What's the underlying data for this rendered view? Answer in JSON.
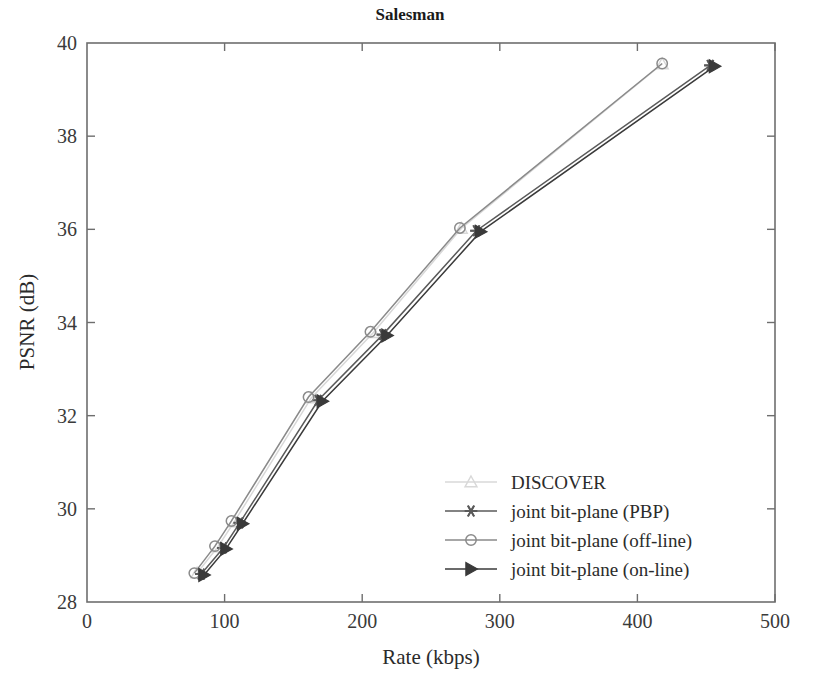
{
  "chart_data": {
    "type": "line",
    "title": "Salesman",
    "xlabel": "Rate (kbps)",
    "ylabel": "PSNR (dB)",
    "xlim": [
      0,
      500
    ],
    "ylim": [
      28,
      40
    ],
    "xticks": [
      "0",
      "100",
      "200",
      "300",
      "400",
      "500"
    ],
    "yticks": [
      "28",
      "30",
      "32",
      "34",
      "36",
      "38",
      "40"
    ],
    "xtick_values": [
      0,
      100,
      200,
      300,
      400,
      500
    ],
    "ytick_values": [
      28,
      30,
      32,
      34,
      36,
      38,
      40
    ],
    "grid": false,
    "legend_position": "lower right",
    "series": [
      {
        "name": "DISCOVER",
        "marker": "triangle-up",
        "color": "#d8d8d8",
        "points": [
          {
            "x": 80,
            "y": 28.62
          },
          {
            "x": 95,
            "y": 29.18
          },
          {
            "x": 107,
            "y": 29.72
          },
          {
            "x": 163,
            "y": 32.38
          },
          {
            "x": 208,
            "y": 33.78
          },
          {
            "x": 272,
            "y": 36.02
          },
          {
            "x": 418,
            "y": 39.55
          }
        ]
      },
      {
        "name": "joint bit-plane (PBP)",
        "marker": "star",
        "color": "#5a5a5a",
        "points": [
          {
            "x": 83,
            "y": 28.6
          },
          {
            "x": 99,
            "y": 29.16
          },
          {
            "x": 111,
            "y": 29.7
          },
          {
            "x": 168,
            "y": 32.33
          },
          {
            "x": 215,
            "y": 33.74
          },
          {
            "x": 283,
            "y": 35.97
          },
          {
            "x": 453,
            "y": 39.52
          }
        ]
      },
      {
        "name": "joint bit-plane (off-line)",
        "marker": "circle",
        "color": "#8a8a8a",
        "points": [
          {
            "x": 78,
            "y": 28.62
          },
          {
            "x": 93,
            "y": 29.2
          },
          {
            "x": 105,
            "y": 29.74
          },
          {
            "x": 161,
            "y": 32.4
          },
          {
            "x": 206,
            "y": 33.8
          },
          {
            "x": 271,
            "y": 36.03
          },
          {
            "x": 418,
            "y": 39.56
          }
        ]
      },
      {
        "name": "joint bit-plane (on-line)",
        "marker": "triangle-right",
        "color": "#3a3a3a",
        "points": [
          {
            "x": 85,
            "y": 28.58
          },
          {
            "x": 101,
            "y": 29.14
          },
          {
            "x": 113,
            "y": 29.68
          },
          {
            "x": 171,
            "y": 32.31
          },
          {
            "x": 218,
            "y": 33.72
          },
          {
            "x": 286,
            "y": 35.95
          },
          {
            "x": 456,
            "y": 39.5
          }
        ]
      }
    ]
  },
  "legend": {
    "items": [
      {
        "label": "DISCOVER"
      },
      {
        "label": "joint bit-plane (PBP)"
      },
      {
        "label": "joint bit-plane (off-line)"
      },
      {
        "label": "joint bit-plane (on-line)"
      }
    ]
  }
}
